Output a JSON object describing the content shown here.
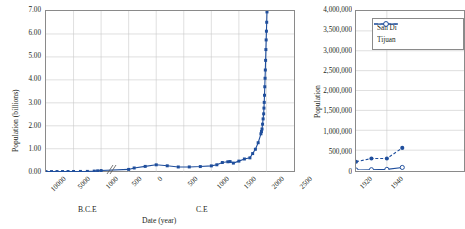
{
  "figure": {
    "background": "#ffffff",
    "accent": "#1f4e9c",
    "grid_color": "#c9c9c9",
    "axis_color": "#8a8a8a"
  },
  "chart_data": [
    {
      "id": "world-population",
      "type": "line",
      "title": "",
      "xlabel": "Date (year)",
      "ylabel": "Population (billions)",
      "era_left_label": "B.C.E",
      "era_right_label": "C.E",
      "grid": true,
      "legend": null,
      "axis_break": true,
      "xlim": [
        -10000,
        2500
      ],
      "ylim": [
        0.0,
        7.0
      ],
      "xticks": [
        "10000",
        "5000",
        "1000",
        "500",
        "0",
        "500",
        "1000",
        "1500",
        "2000",
        "2500"
      ],
      "xtick_values": [
        -10000,
        -5000,
        -1000,
        -500,
        0,
        500,
        1000,
        1500,
        2000,
        2500
      ],
      "yticks": [
        "0.00",
        "1.00",
        "2.00",
        "3.00",
        "4.00",
        "5.00",
        "6.00",
        "7.00"
      ],
      "ytick_values": [
        0,
        1,
        2,
        3,
        4,
        5,
        6,
        7
      ],
      "series": [
        {
          "name": "World population",
          "marker": "filled-square",
          "x": [
            -10000,
            -9000,
            -8000,
            -7000,
            -6000,
            -5000,
            -4000,
            -3000,
            -2000,
            -1500,
            -1000,
            -500,
            -400,
            -200,
            0,
            200,
            400,
            600,
            800,
            1000,
            1100,
            1200,
            1300,
            1340,
            1400,
            1500,
            1600,
            1700,
            1750,
            1800,
            1850,
            1900,
            1910,
            1920,
            1930,
            1940,
            1950,
            1955,
            1960,
            1965,
            1970,
            1975,
            1980,
            1985,
            1990,
            1995,
            2000,
            2005,
            2010
          ],
          "y": [
            0.004,
            0.005,
            0.006,
            0.007,
            0.008,
            0.01,
            0.012,
            0.014,
            0.027,
            0.038,
            0.05,
            0.1,
            0.162,
            0.231,
            0.3,
            0.257,
            0.206,
            0.208,
            0.224,
            0.254,
            0.301,
            0.4,
            0.432,
            0.442,
            0.375,
            0.461,
            0.554,
            0.603,
            0.79,
            0.978,
            1.262,
            1.65,
            1.75,
            1.86,
            2.07,
            2.3,
            2.52,
            2.77,
            3.02,
            3.33,
            3.7,
            4.07,
            4.43,
            4.85,
            5.32,
            5.74,
            6.12,
            6.51,
            6.96
          ]
        }
      ]
    },
    {
      "id": "san-diego-tijuana",
      "type": "line",
      "title": "",
      "xlabel": "",
      "ylabel": "Population",
      "grid": true,
      "clipped_at_image_edge": true,
      "xlim": [
        1920,
        1990
      ],
      "ylim": [
        0,
        4000000
      ],
      "xticks": [
        "1920",
        "1940"
      ],
      "xtick_values": [
        1920,
        1940
      ],
      "yticks": [
        "0",
        "500,000",
        "1,000,000",
        "1,500,000",
        "2,000,000",
        "2,500,000",
        "3,000,000",
        "3,500,000",
        "4,000,000"
      ],
      "ytick_values": [
        0,
        500000,
        1000000,
        1500000,
        2000000,
        2500000,
        3000000,
        3500000,
        4000000
      ],
      "legend": {
        "position": "top-left-inside",
        "entries": [
          {
            "label": "San Di",
            "full_label_truncated": true,
            "marker": "filled-circle",
            "line": "dashed"
          },
          {
            "label": "Tijuan",
            "full_label_truncated": true,
            "marker": "open-circle",
            "line": "solid"
          }
        ]
      },
      "series": [
        {
          "name": "San Di",
          "marker": "filled-circle",
          "line": "dashed",
          "x": [
            1920,
            1930,
            1940,
            1950
          ],
          "y": [
            209659,
            289348,
            289348,
            556808
          ]
        },
        {
          "name": "Tijuan",
          "marker": "open-circle",
          "line": "solid",
          "x": [
            1920,
            1930,
            1940,
            1950
          ],
          "y": [
            1028,
            8384,
            16486,
            65364
          ]
        }
      ]
    }
  ]
}
